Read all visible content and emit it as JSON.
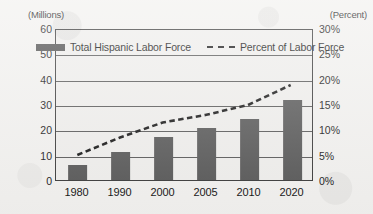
{
  "chart_data": {
    "type": "bar",
    "title": "",
    "subtitle": "",
    "categories": [
      "1980",
      "1990",
      "2000",
      "2005",
      "2010",
      "2020"
    ],
    "xlabel": "",
    "ylabel": "(Millions)",
    "y2label": "(Percent)",
    "ylim": [
      0,
      60
    ],
    "y2lim": [
      0,
      30
    ],
    "yticks": [
      "0",
      "10",
      "20",
      "30",
      "40",
      "50",
      "60"
    ],
    "ytick_values": [
      0,
      10,
      20,
      30,
      40,
      50,
      60
    ],
    "y2ticks": [
      "0%",
      "5%",
      "10%",
      "15%",
      "20%",
      "25%",
      "30%"
    ],
    "y2tick_values": [
      0,
      5,
      10,
      15,
      20,
      25,
      30
    ],
    "grid": true,
    "legend_position": "top-inside",
    "series": [
      {
        "name": "Total Hispanic Labor Force",
        "type": "bar",
        "axis": "left",
        "unit": "millions",
        "color": "#585858",
        "values": [
          6,
          11,
          17,
          20.5,
          24,
          31.5
        ]
      },
      {
        "name": "Percent of Labor Force",
        "type": "line",
        "style": "dashed",
        "axis": "right",
        "unit": "percent",
        "color": "#161616",
        "values": [
          5,
          8.5,
          11.5,
          13,
          15,
          19
        ]
      }
    ]
  },
  "axes": {
    "left_unit_label": "(Millions)",
    "right_unit_label": "(Percent)"
  },
  "legend": {
    "entries": [
      {
        "label": "Total Hispanic Labor Force",
        "marker": "bar-swatch"
      },
      {
        "label": "Percent of Labor Force",
        "marker": "dashed-line"
      }
    ]
  },
  "colors": {
    "bar": "#585858",
    "line": "#161616",
    "grid": "#585858",
    "frame": "#3a3a3a",
    "background": "#f2f1ef",
    "plot_background": "#efeeec",
    "text": "#141414"
  }
}
